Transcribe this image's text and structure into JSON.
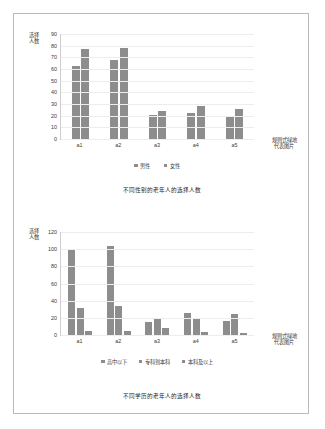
{
  "page": {
    "background_color": "#ffffff",
    "border_color": "#b9b9b9",
    "bar_color": "#8d8d8d"
  },
  "figure1": {
    "caption": "不同性别的老年人的选择人数",
    "y_axis_title": "选择人数",
    "right_note_line1": "规则式绿地",
    "right_note_line2": "代表图片",
    "legend": [
      {
        "label": "男性"
      },
      {
        "label": "女性"
      }
    ]
  },
  "figure2": {
    "caption": "不同学历的老年人的选择人数",
    "y_axis_title": "选择人数",
    "right_note_line1": "规则式绿地",
    "right_note_line2": "代表图片",
    "legend": [
      {
        "label": "高中以下"
      },
      {
        "label": "专科到本科"
      },
      {
        "label": "本科及以上"
      }
    ]
  },
  "chart_data": [
    {
      "type": "bar",
      "title": "不同性别的老年人的选择人数",
      "xlabel": "规则式绿地代表图片",
      "ylabel": "选择人数",
      "categories": [
        "a1",
        "a2",
        "a3",
        "a4",
        "a5"
      ],
      "series": [
        {
          "name": "男性",
          "values": [
            63,
            68,
            21,
            22,
            19
          ]
        },
        {
          "name": "女性",
          "values": [
            77,
            78,
            24,
            28,
            26
          ]
        }
      ],
      "ylim": [
        0,
        90
      ],
      "yticks": [
        0,
        10,
        20,
        30,
        40,
        50,
        60,
        70,
        80,
        90
      ],
      "grid": true,
      "legend_position": "bottom"
    },
    {
      "type": "bar",
      "title": "不同学历的老年人的选择人数",
      "xlabel": "规则式绿地代表图片",
      "ylabel": "选择人数",
      "categories": [
        "a1",
        "a2",
        "a3",
        "a4",
        "a5"
      ],
      "series": [
        {
          "name": "高中以下",
          "values": [
            99,
            104,
            15,
            26,
            16
          ]
        },
        {
          "name": "专科到本科",
          "values": [
            32,
            34,
            20,
            19,
            25
          ]
        },
        {
          "name": "本科及以上",
          "values": [
            5,
            5,
            8,
            3,
            2
          ]
        }
      ],
      "ylim": [
        0,
        120
      ],
      "yticks": [
        0,
        20,
        40,
        60,
        80,
        100,
        120
      ],
      "grid": true,
      "legend_position": "bottom"
    }
  ]
}
